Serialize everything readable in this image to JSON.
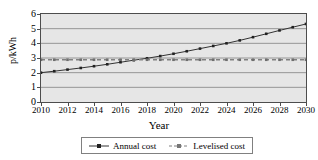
{
  "chart_data": {
    "type": "line",
    "title": "",
    "xlabel": "Year",
    "ylabel": "p/kWh",
    "xlim": [
      2010,
      2030
    ],
    "ylim": [
      0,
      6
    ],
    "grid": true,
    "legend_position": "bottom",
    "x": [
      2010,
      2011,
      2012,
      2013,
      2014,
      2015,
      2016,
      2017,
      2018,
      2019,
      2020,
      2021,
      2022,
      2023,
      2024,
      2025,
      2026,
      2027,
      2028,
      2029,
      2030
    ],
    "xticks": [
      "2010",
      "2012",
      "2014",
      "2016",
      "2018",
      "2020",
      "2022",
      "2024",
      "2026",
      "2028",
      "2030"
    ],
    "yticks": [
      "0",
      "1",
      "2",
      "3",
      "4",
      "5",
      "6"
    ],
    "series": [
      {
        "name": "Annual cost",
        "marker": "square",
        "style": "solid",
        "color": "#333333",
        "values": [
          2.0,
          2.1,
          2.21,
          2.32,
          2.44,
          2.57,
          2.71,
          2.85,
          2.98,
          3.13,
          3.29,
          3.46,
          3.64,
          3.82,
          4.0,
          4.2,
          4.42,
          4.65,
          4.88,
          5.1,
          5.32
        ]
      },
      {
        "name": "Levelised cost",
        "marker": "square",
        "style": "dashed",
        "color": "#808080",
        "values": [
          2.88,
          2.88,
          2.88,
          2.88,
          2.88,
          2.88,
          2.88,
          2.88,
          2.88,
          2.88,
          2.88,
          2.88,
          2.88,
          2.88,
          2.88,
          2.88,
          2.88,
          2.88,
          2.88,
          2.88,
          2.88
        ]
      }
    ],
    "plot_background": "#e6e6e6",
    "axis_color": "#4d4d4d"
  }
}
